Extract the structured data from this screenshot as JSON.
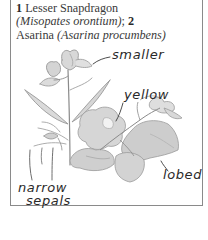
{
  "caption": {
    "item1_number": "1",
    "item1_common": " Lesser Snapdragon ",
    "item1_latin": "(Misopates orontium)",
    "separator": "; ",
    "item2_number": "2",
    "item2_common": " Asarina ",
    "item2_latin": "(Asarina procumbens)"
  },
  "labels": {
    "smaller": "smaller",
    "yellow": "yellow",
    "lobed": "lobed",
    "narrow": "narrow",
    "sepals": "sepals"
  },
  "colors": {
    "border": "#8a8a8a",
    "text": "#3a3a3a",
    "illustration_gray": "#9a9a9a",
    "illustration_light": "#cfcfcf"
  }
}
